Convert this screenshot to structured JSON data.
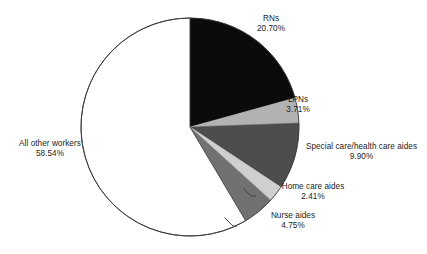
{
  "chart_data": {
    "type": "pie",
    "title": "",
    "subtitle": "",
    "xlabel": "",
    "ylabel": "",
    "grid": false,
    "legend_position": "none",
    "label_style": "outside-with-leader-lines",
    "start_angle_deg": 0,
    "direction": "clockwise",
    "units": "%",
    "categories": [
      "RNs",
      "LPNs",
      "Special care/health care aides",
      "Home care aides",
      "Nurse aides",
      "All other workers"
    ],
    "values": [
      20.7,
      3.71,
      9.9,
      2.41,
      4.75,
      58.54
    ],
    "value_labels": [
      "20.70%",
      "3.71%",
      "9.90%",
      "2.41%",
      "4.75%",
      "58.54%"
    ],
    "colors": [
      "#0b0b0b",
      "#b2b2b2",
      "#4d4d4d",
      "#cfcfcf",
      "#717171",
      "#ffffff"
    ],
    "slices": [
      {
        "name": "RNs",
        "value": 20.7,
        "value_label": "20.70%",
        "color": "#0b0b0b",
        "start_pct": 0.0,
        "end_pct": 20.7
      },
      {
        "name": "LPNs",
        "value": 3.71,
        "value_label": "3.71%",
        "color": "#b2b2b2",
        "start_pct": 20.7,
        "end_pct": 24.41
      },
      {
        "name": "Special care/health care aides",
        "value": 9.9,
        "value_label": "9.90%",
        "color": "#4d4d4d",
        "start_pct": 24.41,
        "end_pct": 34.31
      },
      {
        "name": "Home care aides",
        "value": 2.41,
        "value_label": "2.41%",
        "color": "#cfcfcf",
        "start_pct": 34.31,
        "end_pct": 36.72
      },
      {
        "name": "Nurse aides",
        "value": 4.75,
        "value_label": "4.75%",
        "color": "#717171",
        "start_pct": 36.72,
        "end_pct": 41.47
      },
      {
        "name": "All other workers",
        "value": 58.54,
        "value_label": "58.54%",
        "color": "#ffffff",
        "start_pct": 41.47,
        "end_pct": 100.0
      }
    ]
  },
  "labels": {
    "rns": {
      "name": "RNs",
      "value": "20.70%"
    },
    "lpns": {
      "name": "LPNs",
      "value": "3.71%"
    },
    "special": {
      "name": "Special care/health care aides",
      "value": "9.90%"
    },
    "homecare": {
      "name": "Home care aides",
      "value": "2.41%"
    },
    "nurseaides": {
      "name": "Nurse aides",
      "value": "4.75%"
    },
    "allother": {
      "name": "All other workers",
      "value": "58.54%"
    }
  },
  "style": {
    "outline_color": "#3a3a3a",
    "leader_line_color": "#3a3a3a",
    "background": "#ffffff",
    "text_color": "#1b1b1b"
  }
}
